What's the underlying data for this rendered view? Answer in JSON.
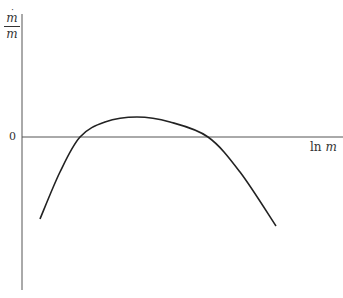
{
  "chart_data": {
    "type": "line",
    "title": "",
    "xlabel": "ln m",
    "ylabel": "ṁ/m",
    "y_tick_labels": [
      "0"
    ],
    "x_tick_labels": [],
    "grid": false,
    "legend": null,
    "series": [
      {
        "name": "growth rate",
        "description": "Inverted-U (concave) curve: negative at small ln m, rises above zero, peaks, then falls below zero at large ln m",
        "points_px": [
          [
            40,
            219
          ],
          [
            60,
            172
          ],
          [
            80,
            137
          ],
          [
            105,
            122
          ],
          [
            137,
            117
          ],
          [
            170,
            122
          ],
          [
            208,
            137
          ],
          [
            240,
            172
          ],
          [
            276,
            226
          ]
        ],
        "zero_crossings_px": [
          80,
          208
        ],
        "peak_px": [
          137,
          117
        ]
      }
    ],
    "axes": {
      "y_axis_x_px": 22,
      "y_axis_top_px": 14,
      "y_axis_bottom_px": 290,
      "x_axis_y_px": 137,
      "x_axis_left_px": 22,
      "x_axis_right_px": 343
    },
    "colors": {
      "axis": "#555555",
      "curve": "#222222"
    }
  },
  "labels": {
    "y_num": "m",
    "y_dot": "˙",
    "y_den": "m",
    "zero": "0",
    "x_ln": "ln ",
    "x_m": "m"
  }
}
